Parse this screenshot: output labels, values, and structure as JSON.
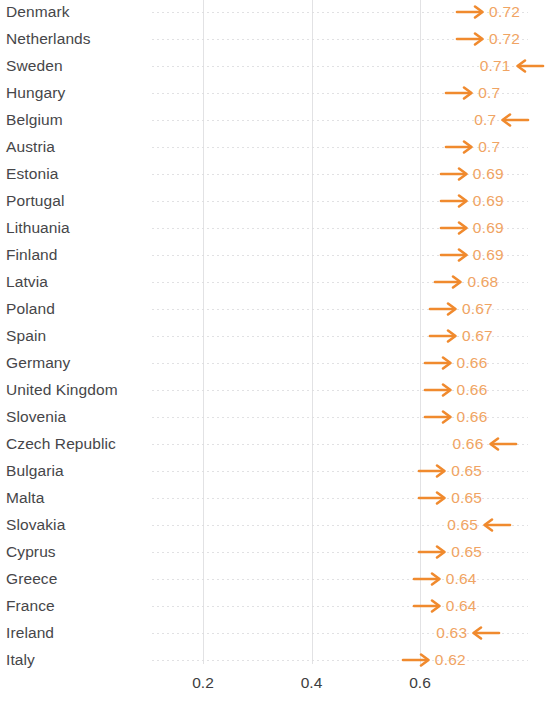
{
  "chart_data": {
    "type": "bar",
    "title": "",
    "xlabel": "",
    "ylabel": "",
    "orientation": "horizontal",
    "grid": "dotted-horizontal-and-vertical",
    "legend": "none",
    "xlim": [
      0.0,
      0.75
    ],
    "xticks": [
      "0.2",
      "0.4",
      "0.6"
    ],
    "xtick_values": [
      0.2,
      0.4,
      0.6
    ],
    "marker_color": "#f08a2e",
    "value_label_color": "#f0a463",
    "category_label_color": "#464649",
    "categories": [
      "Denmark",
      "Netherlands",
      "Sweden",
      "Hungary",
      "Belgium",
      "Austria",
      "Estonia",
      "Portugal",
      "Lithuania",
      "Finland",
      "Latvia",
      "Poland",
      "Spain",
      "Germany",
      "United Kingdom",
      "Slovenia",
      "Czech Republic",
      "Bulgaria",
      "Malta",
      "Slovakia",
      "Cyprus",
      "Greece",
      "France",
      "Ireland",
      "Italy"
    ],
    "values": [
      0.72,
      0.72,
      0.71,
      0.7,
      0.7,
      0.7,
      0.69,
      0.69,
      0.69,
      0.69,
      0.68,
      0.67,
      0.67,
      0.66,
      0.66,
      0.66,
      0.66,
      0.65,
      0.65,
      0.65,
      0.65,
      0.64,
      0.64,
      0.63,
      0.62
    ],
    "rows": [
      {
        "category": "Denmark",
        "value": 0.72,
        "label": "0.72",
        "direction": "right",
        "marker": "arrow-right-icon"
      },
      {
        "category": "Netherlands",
        "value": 0.72,
        "label": "0.72",
        "direction": "right",
        "marker": "arrow-right-icon"
      },
      {
        "category": "Sweden",
        "value": 0.71,
        "label": "0.71",
        "direction": "left",
        "marker": "arrow-left-icon"
      },
      {
        "category": "Hungary",
        "value": 0.7,
        "label": "0.7",
        "direction": "right",
        "marker": "arrow-right-icon"
      },
      {
        "category": "Belgium",
        "value": 0.7,
        "label": "0.7",
        "direction": "left",
        "marker": "arrow-left-icon"
      },
      {
        "category": "Austria",
        "value": 0.7,
        "label": "0.7",
        "direction": "right",
        "marker": "arrow-right-icon"
      },
      {
        "category": "Estonia",
        "value": 0.69,
        "label": "0.69",
        "direction": "right",
        "marker": "arrow-right-icon"
      },
      {
        "category": "Portugal",
        "value": 0.69,
        "label": "0.69",
        "direction": "right",
        "marker": "arrow-right-icon"
      },
      {
        "category": "Lithuania",
        "value": 0.69,
        "label": "0.69",
        "direction": "right",
        "marker": "arrow-right-icon"
      },
      {
        "category": "Finland",
        "value": 0.69,
        "label": "0.69",
        "direction": "right",
        "marker": "arrow-right-icon"
      },
      {
        "category": "Latvia",
        "value": 0.68,
        "label": "0.68",
        "direction": "right",
        "marker": "arrow-right-icon"
      },
      {
        "category": "Poland",
        "value": 0.67,
        "label": "0.67",
        "direction": "right",
        "marker": "arrow-right-icon"
      },
      {
        "category": "Spain",
        "value": 0.67,
        "label": "0.67",
        "direction": "right",
        "marker": "arrow-right-icon"
      },
      {
        "category": "Germany",
        "value": 0.66,
        "label": "0.66",
        "direction": "right",
        "marker": "arrow-right-icon"
      },
      {
        "category": "United Kingdom",
        "value": 0.66,
        "label": "0.66",
        "direction": "right",
        "marker": "arrow-right-icon"
      },
      {
        "category": "Slovenia",
        "value": 0.66,
        "label": "0.66",
        "direction": "right",
        "marker": "arrow-right-icon"
      },
      {
        "category": "Czech Republic",
        "value": 0.66,
        "label": "0.66",
        "direction": "left",
        "marker": "arrow-left-icon"
      },
      {
        "category": "Bulgaria",
        "value": 0.65,
        "label": "0.65",
        "direction": "right",
        "marker": "arrow-right-icon"
      },
      {
        "category": "Malta",
        "value": 0.65,
        "label": "0.65",
        "direction": "right",
        "marker": "arrow-right-icon"
      },
      {
        "category": "Slovakia",
        "value": 0.65,
        "label": "0.65",
        "direction": "left",
        "marker": "arrow-left-icon"
      },
      {
        "category": "Cyprus",
        "value": 0.65,
        "label": "0.65",
        "direction": "right",
        "marker": "arrow-right-icon"
      },
      {
        "category": "Greece",
        "value": 0.64,
        "label": "0.64",
        "direction": "right",
        "marker": "arrow-right-icon"
      },
      {
        "category": "France",
        "value": 0.64,
        "label": "0.64",
        "direction": "right",
        "marker": "arrow-right-icon"
      },
      {
        "category": "Ireland",
        "value": 0.63,
        "label": "0.63",
        "direction": "left",
        "marker": "arrow-left-icon"
      },
      {
        "category": "Italy",
        "value": 0.62,
        "label": "0.62",
        "direction": "right",
        "marker": "arrow-right-icon"
      }
    ]
  }
}
